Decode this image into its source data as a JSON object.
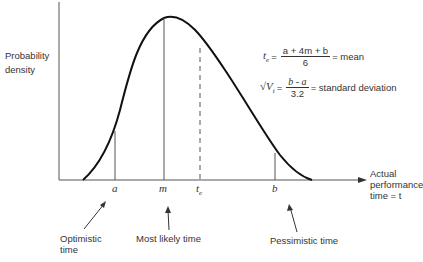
{
  "axes": {
    "y_label_line1": "Probability",
    "y_label_line2": "density",
    "x_label_line1": "Actual",
    "x_label_line2": "performance",
    "x_label_line3": "time = t"
  },
  "ticks": {
    "a": "a",
    "m": "m",
    "te": "t",
    "te_sub": "e",
    "b": "b"
  },
  "annotations": {
    "optimistic_line1": "Optimistic",
    "optimistic_line2": "time",
    "most_likely": "Most likely time",
    "pessimistic": "Pessimistic time"
  },
  "formulas": {
    "mean_lhs": "t",
    "mean_lhs_sub": "e",
    "mean_num": "a + 4m +  b",
    "mean_den": "6",
    "mean_rhs": "= mean",
    "sd_lhs": "√V",
    "sd_lhs_sub": "t",
    "sd_num": "b - a",
    "sd_den": "3.2",
    "sd_rhs": "= standard deviation"
  },
  "colors": {
    "curve": "#111111",
    "axis": "#444444"
  }
}
